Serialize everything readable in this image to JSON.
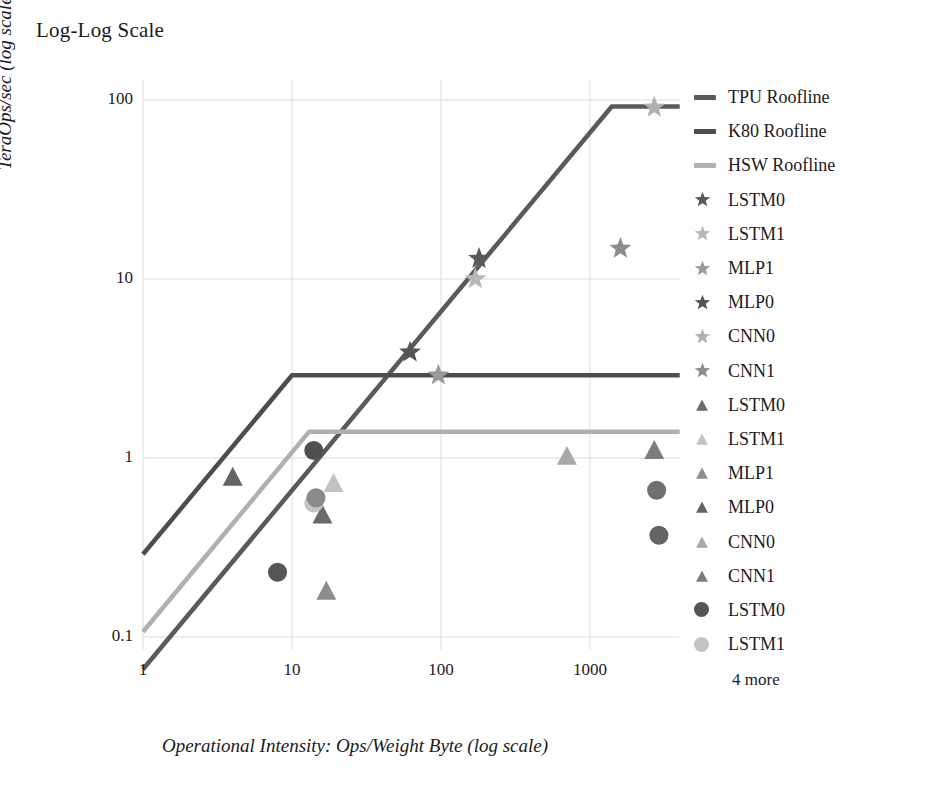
{
  "chart_title": "Log-Log Scale",
  "axes": {
    "x_title": "Operational Intensity: Ops/Weight Byte (log scale)",
    "y_title": "TeraOps/sec (log scale)",
    "x_ticks": [
      "1",
      "10",
      "100",
      "1000"
    ],
    "y_ticks": [
      "100",
      "10",
      "1",
      "0.1"
    ]
  },
  "legend": {
    "more_label": "4 more",
    "items": [
      {
        "label": "TPU Roofline",
        "marker": "line",
        "color": "#5a5a5a"
      },
      {
        "label": "K80 Roofline",
        "marker": "line",
        "color": "#4d4d4d"
      },
      {
        "label": "HSW Roofline",
        "marker": "line",
        "color": "#b0b0b0"
      },
      {
        "label": "LSTM0",
        "marker": "star",
        "color": "#5a5a5a"
      },
      {
        "label": "LSTM1",
        "marker": "star",
        "color": "#b8b8b8"
      },
      {
        "label": "MLP1",
        "marker": "star",
        "color": "#9a9a9a"
      },
      {
        "label": "MLP0",
        "marker": "star",
        "color": "#555555"
      },
      {
        "label": "CNN0",
        "marker": "star",
        "color": "#b0b0b0"
      },
      {
        "label": "CNN1",
        "marker": "star",
        "color": "#8c8c8c"
      },
      {
        "label": "LSTM0",
        "marker": "triangle",
        "color": "#6a6a6a"
      },
      {
        "label": "LSTM1",
        "marker": "triangle",
        "color": "#c2c2c2"
      },
      {
        "label": "MLP1",
        "marker": "triangle",
        "color": "#8e8e8e"
      },
      {
        "label": "MLP0",
        "marker": "triangle",
        "color": "#636363"
      },
      {
        "label": "CNN0",
        "marker": "triangle",
        "color": "#a8a8a8"
      },
      {
        "label": "CNN1",
        "marker": "triangle",
        "color": "#7d7d7d"
      },
      {
        "label": "LSTM0",
        "marker": "circle",
        "color": "#555555"
      },
      {
        "label": "LSTM1",
        "marker": "circle",
        "color": "#c4c4c4"
      }
    ]
  },
  "chart_data": {
    "type": "scatter",
    "title": "Log-Log Scale",
    "xlabel": "Operational Intensity: Ops/Weight Byte (log scale)",
    "ylabel": "TeraOps/sec (log scale)",
    "xscale": "log",
    "yscale": "log",
    "xlim": [
      1,
      4000
    ],
    "ylim": [
      0.08,
      130
    ],
    "xticks": [
      1,
      10,
      100,
      1000
    ],
    "yticks": [
      0.1,
      1,
      10,
      100
    ],
    "grid": true,
    "legend_position": "right",
    "lines": [
      {
        "name": "TPU Roofline",
        "color": "#5a5a5a",
        "width": 4.5,
        "points": [
          [
            1,
            0.066
          ],
          [
            1400,
            92
          ],
          [
            4000,
            92
          ]
        ]
      },
      {
        "name": "K80 Roofline",
        "color": "#4d4d4d",
        "width": 4.5,
        "points": [
          [
            1,
            0.29
          ],
          [
            10,
            2.9
          ],
          [
            4000,
            2.9
          ]
        ]
      },
      {
        "name": "HSW Roofline",
        "color": "#b0b0b0",
        "width": 4.5,
        "points": [
          [
            1,
            0.107
          ],
          [
            13,
            1.4
          ],
          [
            4000,
            1.4
          ]
        ]
      }
    ],
    "series": [
      {
        "name": "LSTM0",
        "marker": "star",
        "color": "#5a5a5a",
        "points": [
          [
            180,
            13.0
          ]
        ]
      },
      {
        "name": "LSTM1",
        "marker": "star",
        "color": "#b8b8b8",
        "points": [
          [
            170,
            10.0
          ]
        ]
      },
      {
        "name": "MLP1",
        "marker": "star",
        "color": "#9a9a9a",
        "points": [
          [
            96,
            2.9
          ]
        ]
      },
      {
        "name": "MLP0",
        "marker": "star",
        "color": "#555555",
        "points": [
          [
            62,
            3.9
          ]
        ]
      },
      {
        "name": "CNN0",
        "marker": "star",
        "color": "#b0b0b0",
        "points": [
          [
            2700,
            91
          ]
        ]
      },
      {
        "name": "CNN1",
        "marker": "star",
        "color": "#8c8c8c",
        "points": [
          [
            1600,
            14.8
          ]
        ]
      },
      {
        "name": "LSTM0",
        "marker": "triangle",
        "color": "#6a6a6a",
        "points": [
          [
            16,
            0.48
          ]
        ]
      },
      {
        "name": "LSTM1",
        "marker": "triangle",
        "color": "#c2c2c2",
        "points": [
          [
            19,
            0.72
          ]
        ]
      },
      {
        "name": "MLP1",
        "marker": "triangle",
        "color": "#8e8e8e",
        "points": [
          [
            17,
            0.18
          ]
        ]
      },
      {
        "name": "MLP0",
        "marker": "triangle",
        "color": "#636363",
        "points": [
          [
            4,
            0.78
          ]
        ]
      },
      {
        "name": "CNN0",
        "marker": "triangle",
        "color": "#a8a8a8",
        "points": [
          [
            700,
            1.02
          ]
        ]
      },
      {
        "name": "CNN1",
        "marker": "triangle",
        "color": "#7d7d7d",
        "points": [
          [
            2700,
            1.1
          ]
        ]
      },
      {
        "name": "LSTM0",
        "marker": "circle",
        "color": "#555555",
        "points": [
          [
            8,
            0.23
          ]
        ]
      },
      {
        "name": "LSTM1",
        "marker": "circle",
        "color": "#c4c4c4",
        "points": [
          [
            14,
            0.56
          ]
        ]
      },
      {
        "name": "MLP1",
        "marker": "circle",
        "color": "#8a8a8a",
        "points": [
          [
            14.5,
            0.6
          ]
        ]
      },
      {
        "name": "MLP0",
        "marker": "circle",
        "color": "#4f4f4f",
        "points": [
          [
            14,
            1.1
          ]
        ]
      },
      {
        "name": "CNN0",
        "marker": "circle",
        "color": "#707070",
        "points": [
          [
            2800,
            0.66
          ]
        ]
      },
      {
        "name": "CNN1",
        "marker": "circle",
        "color": "#646464",
        "points": [
          [
            2900,
            0.37
          ]
        ]
      }
    ]
  }
}
